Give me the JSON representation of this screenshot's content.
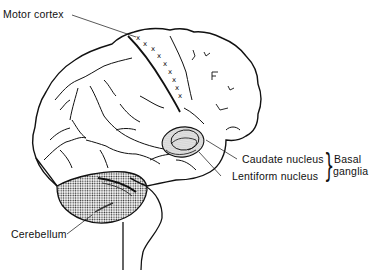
{
  "diagram": {
    "type": "anatomical-illustration",
    "labels": {
      "motor_cortex": "Motor cortex",
      "caudate_nucleus": "Caudate nucleus",
      "lentiform_nucleus": "Lentiform nucleus",
      "basal_ganglia_line1": "Basal",
      "basal_ganglia_line2": "ganglia",
      "cerebellum": "Cerebellum"
    },
    "groupings": [
      {
        "group": "Basal ganglia",
        "members": [
          "Caudate nucleus",
          "Lentiform nucleus"
        ]
      }
    ],
    "markers": {
      "motor_cortex_marker": "x",
      "motor_cortex_marker_count": 9
    },
    "colors": {
      "line": "#111111",
      "background": "#ffffff",
      "stipple": "#222222"
    }
  }
}
